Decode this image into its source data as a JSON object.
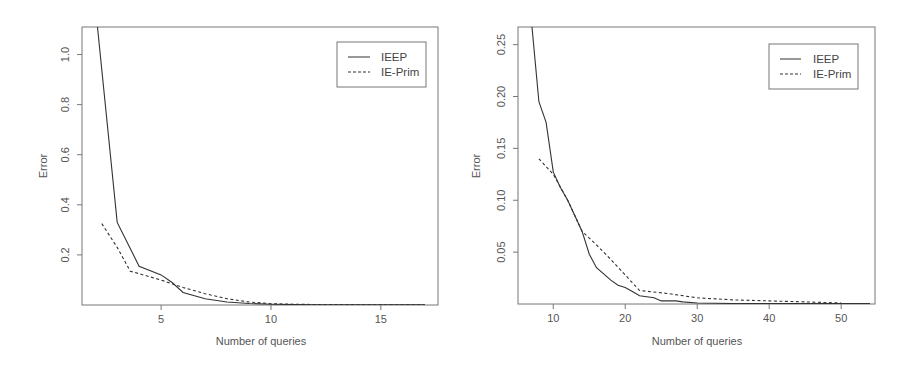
{
  "chart_data": [
    {
      "type": "line",
      "title": "",
      "xlabel": "Number of queries",
      "ylabel": "Error",
      "xlim": [
        1.4,
        17.6
      ],
      "ylim": [
        0,
        1.11
      ],
      "grid": false,
      "legend_position": "top-right",
      "x_ticks": [
        5,
        10,
        15
      ],
      "y_ticks": [
        0.2,
        0.4,
        0.6,
        0.8,
        1.0
      ],
      "x_tick_labels": [
        "5",
        "10",
        "15"
      ],
      "y_tick_labels": [
        "0.2",
        "0.4",
        "0.6",
        "0.8",
        "1.0"
      ],
      "series": [
        {
          "name": "IEEP",
          "style": "solid",
          "x": [
            2,
            3,
            4,
            5,
            5.5,
            6,
            7,
            8,
            9,
            10,
            11,
            12,
            13,
            14,
            15,
            16,
            17
          ],
          "values": [
            1.2,
            0.33,
            0.155,
            0.12,
            0.09,
            0.05,
            0.025,
            0.012,
            0.006,
            0.003,
            0.002,
            0.001,
            0.001,
            0.001,
            0.001,
            0.001,
            0.001
          ]
        },
        {
          "name": "IE-Prim",
          "style": "dashed",
          "x": [
            2.3,
            3,
            3.6,
            5,
            6,
            7,
            8,
            9,
            10,
            11,
            12,
            13,
            14,
            15,
            16,
            17
          ],
          "values": [
            0.325,
            0.23,
            0.135,
            0.1,
            0.07,
            0.045,
            0.025,
            0.012,
            0.005,
            0.003,
            0.002,
            0.002,
            0.001,
            0.001,
            0.001,
            0.001
          ]
        }
      ]
    },
    {
      "type": "line",
      "title": "",
      "xlabel": "Number of queries",
      "ylabel": "Error",
      "xlim": [
        5.1,
        54.7
      ],
      "ylim": [
        0,
        0.267
      ],
      "grid": false,
      "legend_position": "top-right",
      "x_ticks": [
        10,
        20,
        30,
        40,
        50
      ],
      "y_ticks": [
        0.05,
        0.1,
        0.15,
        0.2,
        0.25
      ],
      "x_tick_labels": [
        "10",
        "20",
        "30",
        "40",
        "50"
      ],
      "y_tick_labels": [
        "0.05",
        "0.10",
        "0.15",
        "0.20",
        "0.25"
      ],
      "series": [
        {
          "name": "IEEP",
          "style": "solid",
          "x": [
            7,
            8,
            9,
            10,
            11,
            12,
            13,
            14,
            15,
            16,
            17,
            18,
            19,
            20,
            21,
            22,
            24,
            25,
            27,
            28,
            30,
            35,
            40,
            45,
            50,
            54
          ],
          "values": [
            0.27,
            0.195,
            0.175,
            0.127,
            0.112,
            0.1,
            0.085,
            0.07,
            0.048,
            0.035,
            0.029,
            0.023,
            0.018,
            0.016,
            0.012,
            0.008,
            0.006,
            0.003,
            0.003,
            0.002,
            0.001,
            0.0005,
            0.0005,
            0.0005,
            0.0005,
            0.0005
          ]
        },
        {
          "name": "IE-Prim",
          "style": "dashed",
          "x": [
            8,
            10,
            12,
            14,
            16,
            18,
            20,
            22,
            26,
            30,
            35,
            40,
            45,
            50
          ],
          "values": [
            0.14,
            0.125,
            0.1,
            0.07,
            0.057,
            0.043,
            0.028,
            0.013,
            0.01,
            0.006,
            0.004,
            0.003,
            0.002,
            0.001
          ]
        }
      ]
    }
  ],
  "charts": [
    {
      "xlabel": "Number of queries",
      "ylabel": "Error",
      "legend": [
        "IEEP",
        "IE-Prim"
      ]
    },
    {
      "xlabel": "Number of queries",
      "ylabel": "Error",
      "legend": [
        "IEEP",
        "IE-Prim"
      ]
    }
  ],
  "colors": {
    "line": "#333333",
    "axis": "#777777",
    "text": "#555555"
  }
}
